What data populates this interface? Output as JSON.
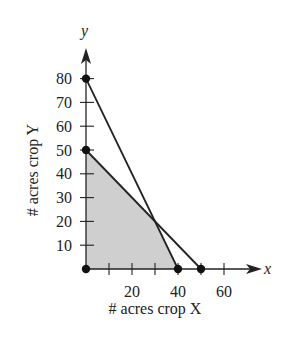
{
  "chart_data": {
    "type": "line",
    "title": "",
    "xlabel": "# acres crop X",
    "ylabel": "# acres crop Y",
    "x_axis_name": "x",
    "y_axis_name": "y",
    "xlim": [
      0,
      65
    ],
    "ylim": [
      0,
      85
    ],
    "x_ticks": [
      10,
      20,
      30,
      40,
      50,
      60
    ],
    "x_tick_labels": [
      "20",
      "40",
      "60"
    ],
    "x_tick_label_values": [
      20,
      40,
      60
    ],
    "y_ticks": [
      10,
      20,
      30,
      40,
      50,
      60,
      70,
      80
    ],
    "y_tick_labels": [
      "10",
      "20",
      "30",
      "40",
      "50",
      "60",
      "70",
      "80"
    ],
    "grid": false,
    "legend": null,
    "series": [
      {
        "name": "constraint-line-1",
        "equation": "2x + y = 80",
        "points": [
          [
            0,
            80
          ],
          [
            40,
            0
          ]
        ]
      },
      {
        "name": "constraint-line-2",
        "equation": "x + y = 50",
        "points": [
          [
            0,
            50
          ],
          [
            50,
            0
          ]
        ]
      }
    ],
    "feasible_region": {
      "vertices": [
        [
          0,
          0
        ],
        [
          0,
          50
        ],
        [
          30,
          20
        ],
        [
          40,
          0
        ]
      ],
      "fill": "#cfcfcf"
    },
    "marked_points": [
      [
        0,
        0
      ],
      [
        0,
        50
      ],
      [
        0,
        80
      ],
      [
        40,
        0
      ],
      [
        50,
        0
      ]
    ],
    "intersection": [
      30,
      20
    ]
  },
  "colors": {
    "line": "#222222",
    "region": "#cfcfcf",
    "background": "#ffffff"
  }
}
